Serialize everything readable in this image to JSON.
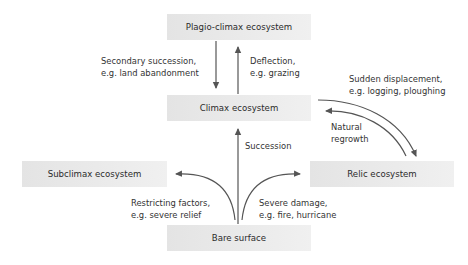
{
  "diagram": {
    "nodes": {
      "plagio_climax": "Plagio-climax ecosystem",
      "climax": "Climax ecosystem",
      "subclimax": "Subclimax ecosystem",
      "relic": "Relic ecosystem",
      "bare_surface": "Bare surface"
    },
    "edges": {
      "secondary_succession": {
        "line1": "Secondary succession,",
        "line2": "e.g. land abandonment",
        "from": "Plagio-climax ecosystem",
        "to": "Climax ecosystem"
      },
      "deflection": {
        "line1": "Deflection,",
        "line2": "e.g. grazing",
        "from": "Climax ecosystem",
        "to": "Plagio-climax ecosystem"
      },
      "sudden_displacement": {
        "line1": "Sudden displacement,",
        "line2": "e.g. logging, ploughing",
        "from": "Climax ecosystem",
        "to": "Relic ecosystem"
      },
      "natural_regrowth": {
        "line1": "Natural",
        "line2": "regrowth",
        "from": "Relic ecosystem",
        "to": "Climax ecosystem"
      },
      "succession": {
        "line1": "Succession",
        "from": "Bare surface",
        "to": "Climax ecosystem"
      },
      "restricting_factors": {
        "line1": "Restricting factors,",
        "line2": "e.g. severe relief",
        "from": "Bare surface",
        "to": "Subclimax ecosystem"
      },
      "severe_damage": {
        "line1": "Severe damage,",
        "line2": "e.g. fire, hurricane",
        "from": "Bare surface",
        "to": "Relic ecosystem"
      }
    },
    "colors": {
      "box_fill": "#e8e8e8",
      "arrow": "#555555",
      "text": "#333333"
    }
  }
}
